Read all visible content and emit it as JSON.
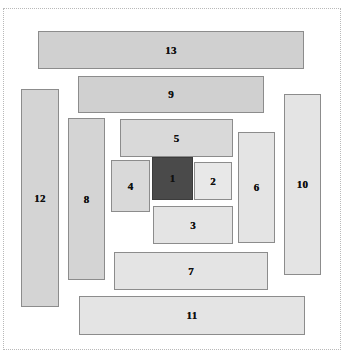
{
  "diagram": {
    "type": "rectangle-packing-diagram",
    "canvas": {
      "width": 358,
      "height": 360,
      "background": "#ffffff"
    },
    "frame": {
      "style": "dotted",
      "color": "#b9b9b9",
      "x": 3,
      "y": 8,
      "width": 338,
      "height": 342
    },
    "palette": {
      "fill_light": "#e8e8e8",
      "fill_medium": "#d4d4d4",
      "fill_dark": "#4a4a4a",
      "stroke": "#8c8c8c",
      "text": "#111111"
    },
    "boxes": [
      {
        "label": "13",
        "x": 38,
        "y": 31,
        "width": 266,
        "height": 38,
        "fill": "#d0d0d0",
        "stroke": "#8c8c8c",
        "text_color": "#111111"
      },
      {
        "label": "9",
        "x": 78,
        "y": 76,
        "width": 186,
        "height": 37,
        "fill": "#d0d0d0",
        "stroke": "#8c8c8c",
        "text_color": "#111111"
      },
      {
        "label": "5",
        "x": 120,
        "y": 119,
        "width": 113,
        "height": 38,
        "fill": "#d9d9d9",
        "stroke": "#8c8c8c",
        "text_color": "#111111"
      },
      {
        "label": "1",
        "x": 152,
        "y": 157,
        "width": 41,
        "height": 43,
        "fill": "#4a4a4a",
        "stroke": "#3c3c3c",
        "text_color": "#111111"
      },
      {
        "label": "2",
        "x": 194,
        "y": 162,
        "width": 38,
        "height": 38,
        "fill": "#e8e8e8",
        "stroke": "#8c8c8c",
        "text_color": "#111111"
      },
      {
        "label": "3",
        "x": 153,
        "y": 206,
        "width": 80,
        "height": 38,
        "fill": "#e4e4e4",
        "stroke": "#8c8c8c",
        "text_color": "#111111"
      },
      {
        "label": "4",
        "x": 111,
        "y": 160,
        "width": 39,
        "height": 52,
        "fill": "#d9d9d9",
        "stroke": "#8c8c8c",
        "text_color": "#111111"
      },
      {
        "label": "6",
        "x": 238,
        "y": 132,
        "width": 37,
        "height": 111,
        "fill": "#e4e4e4",
        "stroke": "#8c8c8c",
        "text_color": "#111111"
      },
      {
        "label": "7",
        "x": 114,
        "y": 252,
        "width": 154,
        "height": 38,
        "fill": "#e4e4e4",
        "stroke": "#8c8c8c",
        "text_color": "#111111"
      },
      {
        "label": "8",
        "x": 68,
        "y": 118,
        "width": 37,
        "height": 162,
        "fill": "#d4d4d4",
        "stroke": "#8c8c8c",
        "text_color": "#111111"
      },
      {
        "label": "10",
        "x": 284,
        "y": 94,
        "width": 37,
        "height": 181,
        "fill": "#e4e4e4",
        "stroke": "#8c8c8c",
        "text_color": "#111111"
      },
      {
        "label": "11",
        "x": 79,
        "y": 296,
        "width": 226,
        "height": 39,
        "fill": "#e4e4e4",
        "stroke": "#8c8c8c",
        "text_color": "#111111"
      },
      {
        "label": "12",
        "x": 21,
        "y": 89,
        "width": 38,
        "height": 218,
        "fill": "#d4d4d4",
        "stroke": "#8c8c8c",
        "text_color": "#111111"
      }
    ]
  }
}
